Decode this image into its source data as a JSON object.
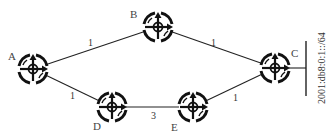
{
  "diagram": {
    "type": "network-topology",
    "nodes": [
      {
        "id": "A",
        "label": "A",
        "x": 33,
        "y": 69
      },
      {
        "id": "B",
        "label": "B",
        "x": 158,
        "y": 27
      },
      {
        "id": "C",
        "label": "C",
        "x": 275,
        "y": 68
      },
      {
        "id": "D",
        "label": "D",
        "x": 112,
        "y": 107
      },
      {
        "id": "E",
        "label": "E",
        "x": 193,
        "y": 107
      }
    ],
    "edges": [
      {
        "from": "A",
        "to": "B",
        "cost": "1"
      },
      {
        "from": "B",
        "to": "C",
        "cost": "1"
      },
      {
        "from": "A",
        "to": "D",
        "cost": "1"
      },
      {
        "from": "D",
        "to": "E",
        "cost": "3"
      },
      {
        "from": "E",
        "to": "C",
        "cost": "1"
      }
    ],
    "network": {
      "prefix": "2001:db8:0:1::/64",
      "attached_to": "C"
    },
    "icon": "router-icon",
    "colors": {
      "stroke": "#1a1a1a",
      "background": "#ffffff"
    }
  }
}
